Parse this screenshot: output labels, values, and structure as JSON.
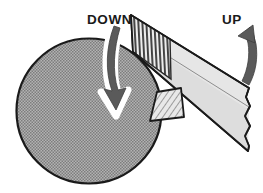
{
  "figure": {
    "labels": {
      "down": "DOWN",
      "up": "UP"
    },
    "colors": {
      "outline": "#1a1a1a",
      "drum_fill": "#9e9e9e",
      "belt_fill": "#e3e3e3",
      "belt_shadow": "#b8b8b8",
      "hatch_stroke": "#3a3a3a",
      "arrow_fill": "#5a5a5a",
      "arrow_halo": "#ffffff",
      "background": "#ffffff"
    },
    "parts": [
      {
        "name": "drum",
        "description": "large halftone-gray circle (sanding drum)",
        "cx": 89,
        "cy": 111,
        "r": 73
      },
      {
        "name": "belt",
        "description": "light gray diagonal abrasive belt with torn right end"
      },
      {
        "name": "belt-hatched-section",
        "description": "vertically striped abrasive section at the left end of the belt"
      },
      {
        "name": "workpiece-wedge",
        "description": "small diagonally hatched quadrilateral below the belt"
      },
      {
        "name": "down-arrow",
        "description": "dark curved arrow pointing down over the drum, white halo"
      },
      {
        "name": "up-arrow",
        "description": "dark curved arrow pointing up at right of the belt"
      }
    ]
  }
}
